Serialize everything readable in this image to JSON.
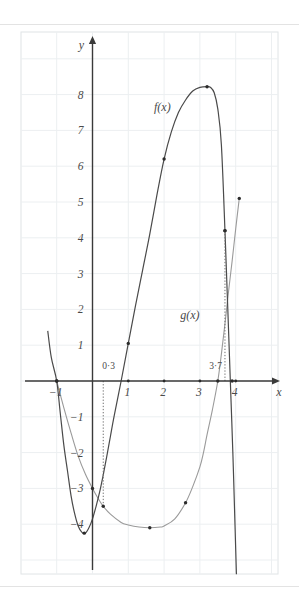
{
  "page": {
    "background_color": "#ffffff",
    "divider_color": "#e3e3e3"
  },
  "figure": {
    "name": "function-graph",
    "grid_color": "#eceff1",
    "frame_color": "#e0e4e6",
    "axis_color": "#3a3a3a",
    "f_color": "#4a4a4a",
    "g_color": "#9a9a9a",
    "point_color": "#2b2b2b",
    "dotted_color": "#6e6e6e"
  },
  "axes": {
    "x_axis_label": "x",
    "y_axis_label": "y",
    "x_ticks": [
      "−1",
      "1",
      "2",
      "3",
      "4"
    ],
    "x_tick_values": [
      -1,
      1,
      2,
      3,
      4
    ],
    "y_ticks": [
      "8",
      "7",
      "6",
      "5",
      "4",
      "3",
      "2",
      "1",
      "−1",
      "−2",
      "−3",
      "−4"
    ],
    "y_tick_values": [
      8,
      7,
      6,
      5,
      4,
      3,
      2,
      1,
      -1,
      -2,
      -3,
      -4
    ],
    "xlim": [
      -1.9,
      5.0
    ],
    "ylim": [
      -5.6,
      9.2
    ],
    "grid": true
  },
  "annotations": {
    "f_label": "f(x)",
    "g_label": "g(x)",
    "marker_left": "0·3",
    "marker_right": "3·7",
    "marker_left_value": 0.3,
    "marker_right_value": 3.7
  },
  "chart_data": {
    "type": "line",
    "title": "",
    "xlabel": "x",
    "ylabel": "y",
    "xlim": [
      -1.9,
      5.0
    ],
    "ylim": [
      -5.6,
      9.2
    ],
    "grid": true,
    "legend": [
      "f(x)",
      "g(x)"
    ],
    "legend_position": "inline-annotation",
    "series": [
      {
        "name": "f(x)",
        "color": "#4a4a4a",
        "points": [
          [
            -1.25,
            1.4
          ],
          [
            -1.15,
            0.65
          ],
          [
            -1.0,
            0.0
          ],
          [
            -0.9,
            -0.9
          ],
          [
            -0.8,
            -1.8
          ],
          [
            -0.7,
            -2.5
          ],
          [
            -0.6,
            -3.2
          ],
          [
            -0.5,
            -3.7
          ],
          [
            -0.4,
            -4.05
          ],
          [
            -0.3,
            -4.22
          ],
          [
            -0.2,
            -4.25
          ],
          [
            -0.1,
            -4.1
          ],
          [
            0.0,
            -3.85
          ],
          [
            0.1,
            -3.5
          ],
          [
            0.2,
            -3.1
          ],
          [
            0.3,
            -2.62
          ],
          [
            0.4,
            -2.1
          ],
          [
            0.5,
            -1.55
          ],
          [
            0.6,
            -1.0
          ],
          [
            0.8,
            0.0
          ],
          [
            1.0,
            1.05
          ],
          [
            1.2,
            2.1
          ],
          [
            1.4,
            3.1
          ],
          [
            1.6,
            4.1
          ],
          [
            1.8,
            5.2
          ],
          [
            2.0,
            6.2
          ],
          [
            2.2,
            6.95
          ],
          [
            2.4,
            7.5
          ],
          [
            2.6,
            7.85
          ],
          [
            2.8,
            8.1
          ],
          [
            3.0,
            8.2
          ],
          [
            3.2,
            8.22
          ],
          [
            3.3,
            8.2
          ],
          [
            3.4,
            8.05
          ],
          [
            3.5,
            7.6
          ],
          [
            3.6,
            6.6
          ],
          [
            3.7,
            4.2
          ],
          [
            3.78,
            2.0
          ],
          [
            3.85,
            0.0
          ],
          [
            3.92,
            -2.0
          ],
          [
            3.98,
            -4.0
          ],
          [
            4.02,
            -5.4
          ]
        ],
        "marked_points": [
          [
            -1.0,
            0.0
          ],
          [
            -0.23,
            -4.25
          ],
          [
            1.0,
            1.05
          ],
          [
            2.0,
            6.2
          ],
          [
            3.2,
            8.22
          ],
          [
            3.7,
            4.2
          ],
          [
            3.9,
            0.0
          ]
        ]
      },
      {
        "name": "g(x)",
        "color": "#9a9a9a",
        "points": [
          [
            -1.0,
            0.0
          ],
          [
            -0.8,
            -0.75
          ],
          [
            -0.6,
            -1.45
          ],
          [
            -0.4,
            -2.1
          ],
          [
            -0.2,
            -2.6
          ],
          [
            0.0,
            -3.0
          ],
          [
            0.2,
            -3.35
          ],
          [
            0.3,
            -3.5
          ],
          [
            0.5,
            -3.72
          ],
          [
            0.8,
            -3.95
          ],
          [
            1.0,
            -4.02
          ],
          [
            1.3,
            -4.08
          ],
          [
            1.6,
            -4.1
          ],
          [
            1.9,
            -4.08
          ],
          [
            2.0,
            -4.05
          ],
          [
            2.3,
            -3.85
          ],
          [
            2.6,
            -3.4
          ],
          [
            2.8,
            -2.95
          ],
          [
            3.0,
            -2.4
          ],
          [
            3.1,
            -2.0
          ],
          [
            3.2,
            -1.5
          ],
          [
            3.35,
            -0.8
          ],
          [
            3.5,
            0.0
          ],
          [
            3.6,
            0.75
          ],
          [
            3.7,
            1.6
          ],
          [
            3.8,
            2.5
          ],
          [
            3.9,
            3.35
          ],
          [
            4.0,
            4.25
          ],
          [
            4.1,
            5.1
          ]
        ],
        "marked_points": [
          [
            -1.0,
            0.0
          ],
          [
            0.0,
            -3.0
          ],
          [
            0.3,
            -3.5
          ],
          [
            1.6,
            -4.1
          ],
          [
            2.6,
            -3.4
          ],
          [
            3.5,
            0.0
          ],
          [
            3.7,
            4.2
          ],
          [
            4.1,
            5.1
          ]
        ]
      }
    ],
    "vertical_dotted_lines": [
      {
        "x": 0.3,
        "label": "0·3",
        "from_y": 0,
        "to_y": -3.5
      },
      {
        "x": 3.7,
        "label": "3·7",
        "from_y": 0,
        "to_y": 4.2
      }
    ]
  }
}
